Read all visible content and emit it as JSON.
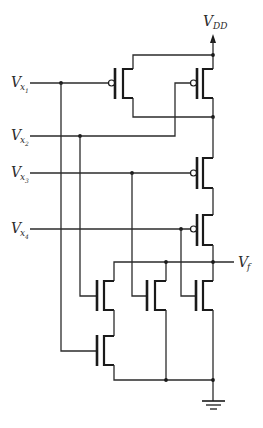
{
  "diagram": {
    "type": "CMOS logic gate schematic",
    "supply": {
      "label": "V",
      "sub": "DD"
    },
    "output": {
      "label": "V",
      "sub": "f"
    },
    "inputs": [
      {
        "label": "V",
        "sub": "x",
        "subsub": "1"
      },
      {
        "label": "V",
        "sub": "x",
        "subsub": "2"
      },
      {
        "label": "V",
        "sub": "x",
        "subsub": "3"
      },
      {
        "label": "V",
        "sub": "x",
        "subsub": "4"
      }
    ],
    "pull_up_network": [
      {
        "type": "PMOS",
        "gate": "x1",
        "connection": "parallel with x2"
      },
      {
        "type": "PMOS",
        "gate": "x2",
        "connection": "parallel with x1"
      },
      {
        "type": "PMOS",
        "gate": "x3",
        "connection": "series"
      },
      {
        "type": "PMOS",
        "gate": "x4",
        "connection": "series"
      }
    ],
    "pull_down_network": [
      {
        "type": "NMOS",
        "gate": "x2",
        "connection": "series with x1"
      },
      {
        "type": "NMOS",
        "gate": "x1",
        "connection": "series with x2"
      },
      {
        "type": "NMOS",
        "gate": "x3",
        "connection": "parallel"
      },
      {
        "type": "NMOS",
        "gate": "x4",
        "connection": "parallel"
      }
    ],
    "ground": "ground-symbol"
  }
}
